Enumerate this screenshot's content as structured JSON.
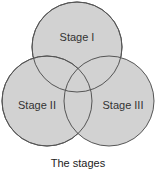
{
  "diagram": {
    "type": "venn",
    "sets": [
      {
        "id": "stage-1",
        "label": "Stage I"
      },
      {
        "id": "stage-2",
        "label": "Stage II"
      },
      {
        "id": "stage-3",
        "label": "Stage III"
      }
    ],
    "caption": "The stages",
    "colors": {
      "fill": "#d2d2d2",
      "stroke": "#555555"
    }
  }
}
